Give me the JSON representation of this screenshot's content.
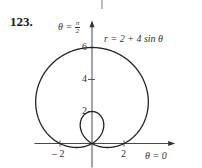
{
  "problem": {
    "number": "123."
  },
  "chart_data": {
    "type": "line",
    "subtype": "polar",
    "title": "r = 2 + 4 sin θ",
    "equation": {
      "a": 2,
      "b": 4,
      "trig": "sin"
    },
    "axis_labels": {
      "polar_axis": "θ = 0",
      "vertical_axis": {
        "prefix": "θ =",
        "numerator": "π",
        "denominator": "2"
      }
    },
    "x_ticks": [
      {
        "value": -2,
        "label": "– 2"
      },
      {
        "value": 2,
        "label": "2"
      }
    ],
    "y_ticks": [
      {
        "value": 2,
        "label": "2"
      },
      {
        "value": 4,
        "label": "4"
      },
      {
        "value": 6,
        "label": "6"
      }
    ],
    "xlim": [
      -3.6,
      5.2
    ],
    "ylim": [
      -1.5,
      7.7
    ],
    "grid": false,
    "legend": null,
    "features": {
      "outer_loop_max_r": 6,
      "inner_loop_max_r": 2,
      "x_intercepts": [
        -2,
        2
      ]
    }
  },
  "style": {
    "curve_color": "#222222",
    "axis_color": "#333333",
    "text_color": "#333333"
  }
}
